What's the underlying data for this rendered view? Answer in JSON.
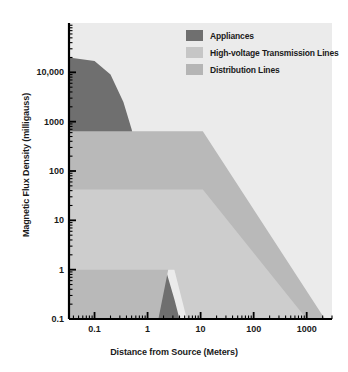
{
  "chart_data": {
    "type": "area",
    "title": "",
    "xlabel": "Distance from Source (Meters)",
    "ylabel": "Magnetic Flux Density (milligauss)",
    "xscale": "log",
    "yscale": "log",
    "xlim": [
      0.033,
      3000.0
    ],
    "ylim": [
      0.1,
      100000.0
    ],
    "grid": false,
    "legend_position": "top-right",
    "xticks": [
      "0.1",
      "1",
      "10",
      "100",
      "1000"
    ],
    "xtick_values": [
      0.1,
      1,
      10,
      100,
      1000
    ],
    "yticks": [
      "0.1",
      "1",
      "10",
      "100",
      "1000",
      "10,000"
    ],
    "ytick_values": [
      0.1,
      1,
      10,
      100,
      1000,
      10000
    ],
    "plot_background": "#ebebeb",
    "series": [
      {
        "name": "Appliances",
        "color": "#6f6f6f",
        "upper": [
          {
            "x": 0.033,
            "y": 20000
          },
          {
            "x": 0.1,
            "y": 17000
          },
          {
            "x": 0.2,
            "y": 9000
          },
          {
            "x": 0.35,
            "y": 2500
          },
          {
            "x": 0.5,
            "y": 700
          },
          {
            "x": 0.7,
            "y": 150
          },
          {
            "x": 1.0,
            "y": 30
          },
          {
            "x": 1.5,
            "y": 5
          },
          {
            "x": 2.2,
            "y": 1.0
          },
          {
            "x": 3.2,
            "y": 0.25
          },
          {
            "x": 4.0,
            "y": 0.1
          }
        ],
        "lower": [
          {
            "x": 0.033,
            "y": 7
          },
          {
            "x": 0.08,
            "y": 6.5
          },
          {
            "x": 0.15,
            "y": 5
          },
          {
            "x": 0.25,
            "y": 3.2
          },
          {
            "x": 0.4,
            "y": 1.8
          },
          {
            "x": 0.6,
            "y": 0.85
          },
          {
            "x": 0.85,
            "y": 0.38
          },
          {
            "x": 1.1,
            "y": 0.2
          },
          {
            "x": 1.4,
            "y": 0.1
          }
        ]
      },
      {
        "name": "High-voltage Transmission Lines",
        "color": "#b9b9b9",
        "upper": [
          {
            "x": 0.033,
            "y": 640
          },
          {
            "x": 11.0,
            "y": 640
          },
          {
            "x": 2200,
            "y": 0.1
          }
        ],
        "lower": [
          {
            "x": 0.033,
            "y": 0.1
          },
          {
            "x": 1.6,
            "y": 0.1
          },
          {
            "x": 3.0,
            "y": 3.0
          },
          {
            "x": 10.0,
            "y": 17.0
          },
          {
            "x": 350,
            "y": 0.1
          }
        ]
      },
      {
        "name": "Distribution Lines",
        "color": "#cdcdcd",
        "upper": [
          {
            "x": 0.033,
            "y": 42
          },
          {
            "x": 11.0,
            "y": 42
          },
          {
            "x": 1000,
            "y": 0.1
          }
        ],
        "lower": [
          {
            "x": 0.033,
            "y": 1.0
          },
          {
            "x": 3.2,
            "y": 1.0
          },
          {
            "x": 5.5,
            "y": 0.1
          },
          {
            "x": 1000,
            "y": 0.1
          }
        ]
      }
    ]
  },
  "legend": {
    "items": [
      {
        "label": "Appliances",
        "color": "#6f6f6f"
      },
      {
        "label": "High-voltage Transmission Lines",
        "color": "#c6c6c6"
      },
      {
        "label": "Distribution Lines",
        "color": "#b5b5b5"
      }
    ]
  },
  "axes": {
    "x_title": "Distance from Source (Meters)",
    "y_title": "Magnetic Flux Density (milligauss)"
  }
}
